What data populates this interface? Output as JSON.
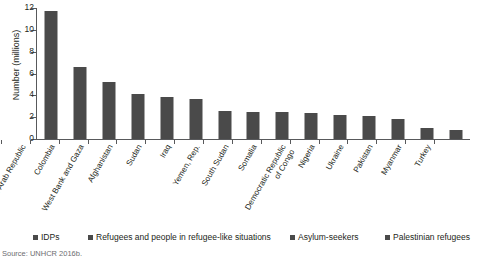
{
  "chart_data": {
    "type": "bar",
    "title": "",
    "xlabel": "",
    "ylabel": "Number (millions)",
    "ylim": [
      0,
      12
    ],
    "yticks": [
      0,
      2,
      4,
      6,
      8,
      10,
      12
    ],
    "grid": false,
    "legend_position": "bottom",
    "categories": [
      "Syrian Arab Republic",
      "Colombia",
      "West Bank and Gaza",
      "Afghanistan",
      "Sudan",
      "Iraq",
      "Yemen, Rep.",
      "South Sudan",
      "Somalia",
      "Democratic Republic\nof Congo",
      "Nigeria",
      "Ukraine",
      "Pakistan",
      "Myanmar",
      "Turkey"
    ],
    "values": [
      11.7,
      6.6,
      5.2,
      4.1,
      3.85,
      3.7,
      2.55,
      2.5,
      2.45,
      2.35,
      2.2,
      2.1,
      1.85,
      1.0,
      0.8
    ],
    "series": [
      {
        "name": "IDPs",
        "values": [
          11.7,
          6.6,
          5.2,
          4.1,
          3.85,
          3.7,
          2.55,
          2.5,
          2.45,
          2.35,
          2.2,
          2.1,
          1.85,
          1.0,
          0.8
        ]
      }
    ],
    "legend": [
      "IDPs",
      "Refugees and people in refugee-like situations",
      "Asylum-seekers",
      "Palestinian refugees"
    ],
    "bar_color": "#4a4a4a",
    "axis_color": "#58595b"
  },
  "source_note": "Source: UNHCR 2016b."
}
